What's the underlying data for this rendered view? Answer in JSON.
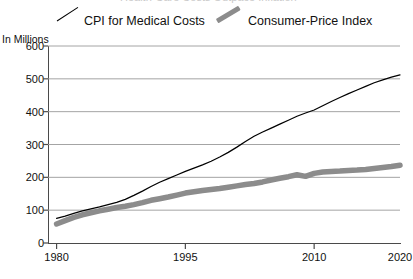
{
  "title_clipped": "Health-Care Costs Outpace Inflation",
  "axis": {
    "y_caption": "In Millions",
    "y_ticks": [
      600,
      500,
      400,
      300,
      200,
      100,
      0
    ],
    "x_ticks": [
      1980,
      1995,
      2010,
      2020
    ]
  },
  "legend": {
    "items": [
      {
        "label": "CPI for Medical Costs",
        "swatch": "thin-black-diagonal-line",
        "color": "#000000"
      },
      {
        "label": "Consumer-Price Index",
        "swatch": "thick-gray-diagonal-line",
        "color": "#8c8c8c"
      }
    ]
  },
  "chart_data": {
    "type": "line",
    "title": "Health-Care Costs Outpace Inflation",
    "xlabel": "",
    "ylabel": "In Millions",
    "ylim": [
      0,
      600
    ],
    "xlim": [
      1979,
      2020
    ],
    "grid": true,
    "legend_position": "top",
    "x": [
      1980,
      1981,
      1982,
      1983,
      1984,
      1985,
      1986,
      1987,
      1988,
      1989,
      1990,
      1991,
      1992,
      1993,
      1994,
      1995,
      1996,
      1997,
      1998,
      1999,
      2000,
      2001,
      2002,
      2003,
      2004,
      2005,
      2006,
      2007,
      2008,
      2009,
      2010,
      2011,
      2012,
      2013,
      2014,
      2015,
      2016,
      2017,
      2018,
      2019,
      2020
    ],
    "series": [
      {
        "name": "CPI for Medical Costs",
        "color": "#000000",
        "style": "thin-solid",
        "values": [
          75,
          82,
          90,
          98,
          104,
          110,
          117,
          124,
          133,
          145,
          158,
          172,
          185,
          196,
          207,
          218,
          228,
          238,
          249,
          262,
          276,
          292,
          309,
          325,
          338,
          350,
          362,
          374,
          386,
          396,
          405,
          418,
          431,
          443,
          455,
          466,
          477,
          488,
          497,
          505,
          512
        ]
      },
      {
        "name": "Consumer-Price Index",
        "color": "#8c8c8c",
        "style": "thick-solid",
        "values": [
          58,
          68,
          78,
          86,
          92,
          98,
          103,
          108,
          112,
          117,
          123,
          130,
          135,
          140,
          146,
          152,
          156,
          160,
          163,
          166,
          170,
          174,
          178,
          181,
          186,
          192,
          197,
          202,
          208,
          203,
          212,
          216,
          218,
          219,
          221,
          222,
          224,
          227,
          230,
          233,
          237
        ]
      }
    ]
  }
}
